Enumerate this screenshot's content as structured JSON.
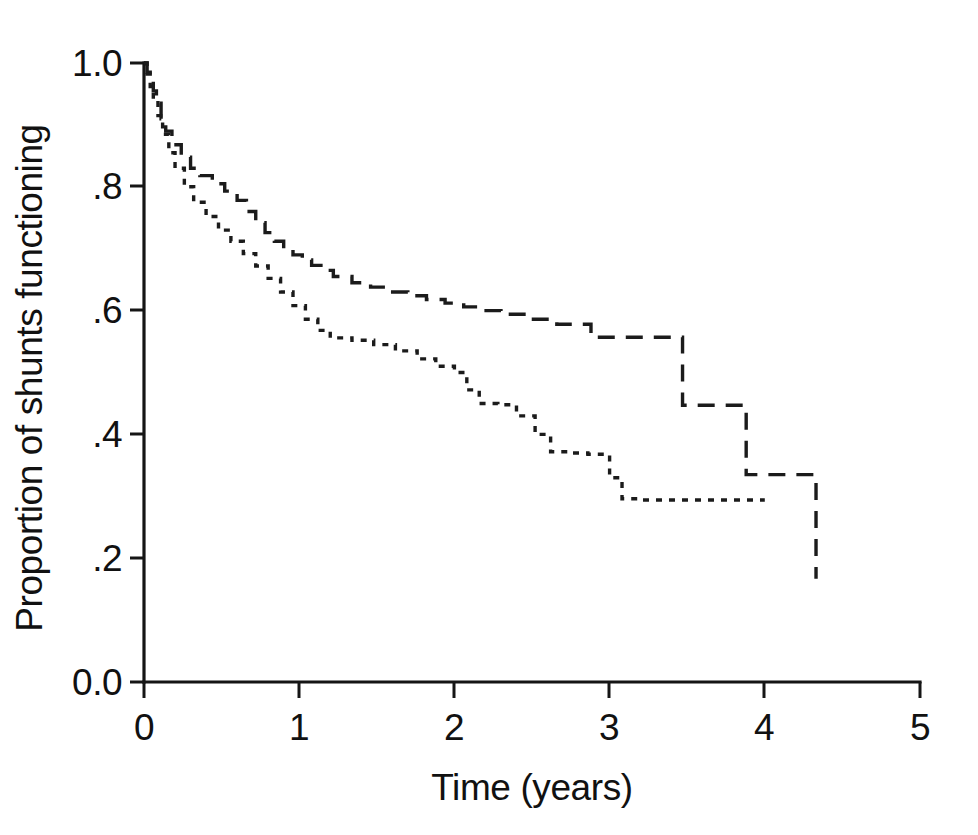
{
  "figure": {
    "kind": "kaplan-meier-survival-plot",
    "background_color": "#ffffff",
    "line_color": "#1b1b1b"
  },
  "chart_data": {
    "type": "line",
    "title": "",
    "subtitle": "",
    "xlabel": "Time (years)",
    "ylabel": "Proportion of shunts functioning",
    "xlim": [
      0,
      5
    ],
    "ylim": [
      0.0,
      1.0
    ],
    "xticks": [
      0,
      1,
      2,
      3,
      4,
      5
    ],
    "xticklabels": [
      "0",
      "1",
      "2",
      "3",
      "4",
      "5"
    ],
    "yticks": [
      0.0,
      0.2,
      0.4,
      0.6,
      0.8,
      1.0
    ],
    "yticklabels": [
      "0.0",
      ".2",
      ".4",
      ".6",
      ".8",
      "1.0"
    ],
    "grid": false,
    "legend": "none",
    "step_style": "post",
    "series": [
      {
        "name": "upper curve",
        "linestyle": "dashed",
        "color": "#1b1b1b",
        "x": [
          0.0,
          0.02,
          0.04,
          0.06,
          0.08,
          0.11,
          0.14,
          0.18,
          0.24,
          0.3,
          0.36,
          0.44,
          0.52,
          0.6,
          0.66,
          0.72,
          0.78,
          0.84,
          0.9,
          0.96,
          1.02,
          1.08,
          1.14,
          1.22,
          1.34,
          1.46,
          1.58,
          1.7,
          1.82,
          1.94,
          2.06,
          2.18,
          2.3,
          2.48,
          2.66,
          2.88,
          2.9,
          3.1,
          3.25,
          3.45,
          3.47,
          3.7,
          3.86,
          3.88,
          4.1,
          4.33
        ],
        "y": [
          1.0,
          0.985,
          0.97,
          0.955,
          0.935,
          0.91,
          0.89,
          0.868,
          0.848,
          0.83,
          0.818,
          0.805,
          0.793,
          0.778,
          0.76,
          0.742,
          0.726,
          0.712,
          0.7,
          0.69,
          0.682,
          0.673,
          0.665,
          0.655,
          0.645,
          0.638,
          0.63,
          0.624,
          0.618,
          0.612,
          0.606,
          0.6,
          0.594,
          0.586,
          0.578,
          0.557,
          0.557,
          0.557,
          0.557,
          0.557,
          0.447,
          0.447,
          0.447,
          0.335,
          0.335,
          0.167
        ]
      },
      {
        "name": "lower curve",
        "linestyle": "dotted",
        "color": "#1b1b1b",
        "x": [
          0.0,
          0.02,
          0.04,
          0.06,
          0.09,
          0.12,
          0.16,
          0.2,
          0.26,
          0.32,
          0.4,
          0.48,
          0.56,
          0.64,
          0.72,
          0.8,
          0.88,
          0.96,
          1.04,
          1.12,
          1.2,
          1.34,
          1.48,
          1.62,
          1.76,
          1.88,
          2.0,
          2.08,
          2.16,
          2.28,
          2.4,
          2.52,
          2.62,
          2.74,
          2.86,
          3.0,
          3.08,
          3.2,
          3.4,
          3.6,
          3.8,
          4.0
        ],
        "y": [
          1.0,
          0.982,
          0.962,
          0.942,
          0.915,
          0.885,
          0.855,
          0.83,
          0.8,
          0.775,
          0.752,
          0.73,
          0.712,
          0.692,
          0.672,
          0.652,
          0.63,
          0.608,
          0.586,
          0.568,
          0.556,
          0.552,
          0.545,
          0.535,
          0.522,
          0.51,
          0.5,
          0.472,
          0.45,
          0.448,
          0.43,
          0.4,
          0.372,
          0.37,
          0.368,
          0.33,
          0.296,
          0.294,
          0.294,
          0.294,
          0.294,
          0.294
        ]
      }
    ],
    "annotations": []
  }
}
